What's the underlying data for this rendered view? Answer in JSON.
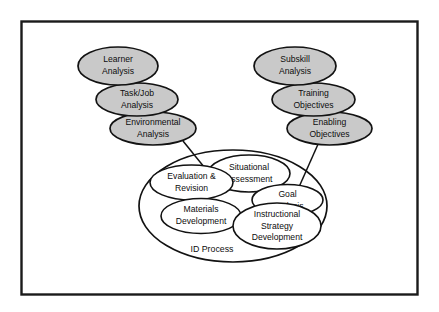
{
  "diagram": {
    "title_label": "ID Process",
    "colors": {
      "shaded_fill": "#c9c9c9",
      "open_fill": "#ffffff",
      "stroke": "#121212",
      "frame_stroke": "#1a1a1a",
      "background": "#ffffff"
    },
    "frame": {
      "name": "diagram-border"
    },
    "left_cluster": {
      "name": "analysis-inputs-cluster",
      "nodes": [
        {
          "id": "learner-analysis",
          "line1": "Learner",
          "line2": "Analysis"
        },
        {
          "id": "task-job-analysis",
          "line1": "Task/Job",
          "line2": "Analysis"
        },
        {
          "id": "environmental-analysis",
          "line1": "Environmental",
          "line2": "Analysis"
        }
      ]
    },
    "right_cluster": {
      "name": "objectives-inputs-cluster",
      "nodes": [
        {
          "id": "subskill-analysis",
          "line1": "Subskill",
          "line2": "Analysis"
        },
        {
          "id": "training-objectives",
          "line1": "Training",
          "line2": "Objectives"
        },
        {
          "id": "enabling-objectives",
          "line1": "Enabling",
          "line2": "Objectives"
        }
      ]
    },
    "process_group": {
      "name": "id-process-group",
      "outer_label": "ID Process",
      "nodes": [
        {
          "id": "situational-assessment",
          "line1": "Situational",
          "line2": "Assessment",
          "line3": ""
        },
        {
          "id": "evaluation-revision",
          "line1": "Evaluation &",
          "line2": "Revision",
          "line3": ""
        },
        {
          "id": "goal-analysis",
          "line1": "Goal",
          "line2": "Analysis",
          "line3": ""
        },
        {
          "id": "materials-development",
          "line1": "Materials",
          "line2": "Development",
          "line3": ""
        },
        {
          "id": "instructional-strategy-development",
          "line1": "Instructional",
          "line2": "Strategy",
          "line3": "Development"
        }
      ]
    },
    "connectors": [
      {
        "id": "environmental-to-situational",
        "from": "environmental-analysis",
        "to": "situational-assessment"
      },
      {
        "id": "enabling-to-goal",
        "from": "enabling-objectives",
        "to": "goal-analysis"
      }
    ]
  }
}
